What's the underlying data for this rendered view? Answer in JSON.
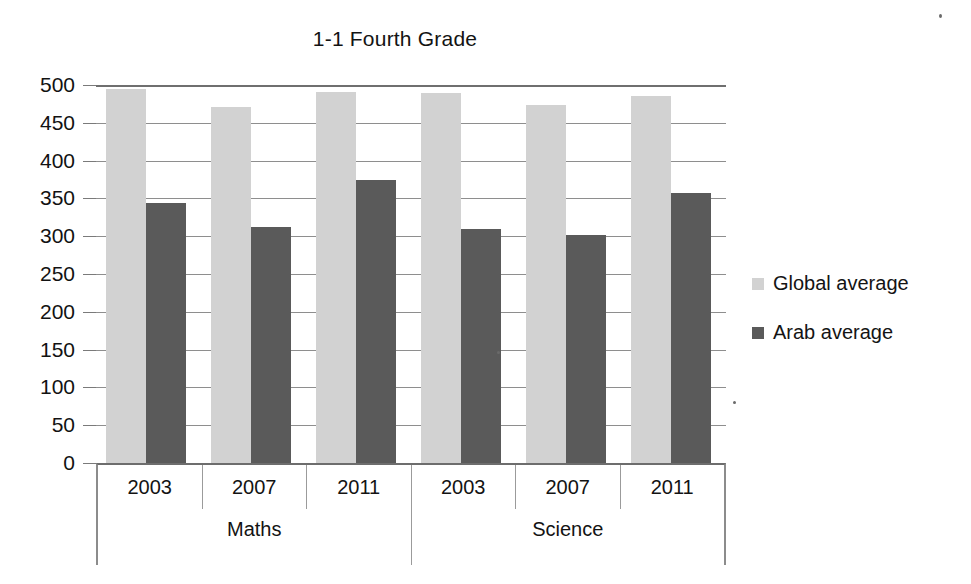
{
  "chart_data": {
    "type": "bar",
    "title": "1-1 Fourth Grade",
    "xlabel": "",
    "ylabel": "",
    "ylim": [
      0,
      500
    ],
    "ytick_step": 50,
    "yticks": [
      "500",
      "450",
      "400",
      "350",
      "300",
      "250",
      "200",
      "150",
      "100",
      "50",
      "0"
    ],
    "grid": true,
    "legend_position": "right",
    "categories": [
      "2003",
      "2007",
      "2011",
      "2003",
      "2007",
      "2011"
    ],
    "groups": [
      {
        "label": "Maths",
        "span": 3
      },
      {
        "label": "Science",
        "span": 3
      }
    ],
    "series": [
      {
        "name": "Global average",
        "color": "#d2d2d2",
        "values": [
          495,
          471,
          491,
          489,
          474,
          486
        ]
      },
      {
        "name": "Arab average",
        "color": "#5a5a5a",
        "values": [
          344,
          312,
          374,
          309,
          301,
          357
        ]
      }
    ]
  },
  "legend": {
    "items": [
      {
        "label": "Global average",
        "color": "#d2d2d2"
      },
      {
        "label": "Arab average",
        "color": "#5a5a5a"
      }
    ]
  }
}
